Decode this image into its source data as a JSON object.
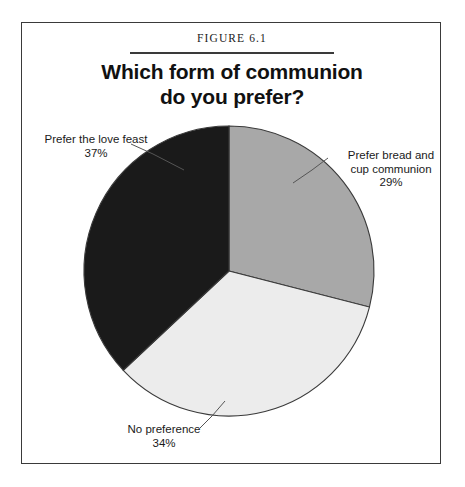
{
  "figure": {
    "caption": "Figure 6.1",
    "title_line_1": "Which form of communion",
    "title_line_2": "do you prefer?"
  },
  "labels": {
    "love_feast": {
      "line_1": "Prefer the love feast",
      "percent": "37%"
    },
    "bread_cup": {
      "line_1": "Prefer bread and",
      "line_2": "cup communion",
      "percent": "29%"
    },
    "no_preference": {
      "line_1": "No preference",
      "percent": "34%"
    }
  },
  "colors": {
    "slice_bread_cup": "#a8a8a8",
    "slice_no_preference": "#ececec",
    "slice_love_feast": "#1a1a1a",
    "outline": "#3a3a3a",
    "frame": "#3a3a3a",
    "text": "#1a1a1a"
  },
  "chart_data": {
    "type": "pie",
    "title": "Which form of communion do you prefer?",
    "subtitle": "Figure 6.1",
    "xlabel": "",
    "ylabel": "",
    "legend_position": "none",
    "labels_position": "outside-with-leader-lines",
    "start_angle_deg": 0,
    "direction": "clockwise",
    "categories": [
      "Prefer bread and cup communion",
      "No preference",
      "Prefer the love feast"
    ],
    "values": [
      29,
      34,
      37
    ],
    "value_labels": [
      "29%",
      "34%",
      "37%"
    ],
    "slice_colors": [
      "#a8a8a8",
      "#ececec",
      "#1a1a1a"
    ],
    "units": "percent",
    "total": 100
  }
}
